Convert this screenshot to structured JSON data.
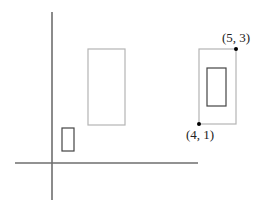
{
  "diagram": {
    "colors": {
      "axis": "#6e6e6e",
      "light_rect": "#b4b4b4",
      "dark_rect": "#444444",
      "point": "#000000",
      "label": "#222222"
    },
    "axes": {
      "vertical": {
        "x": 52,
        "y1": 12,
        "y2": 200
      },
      "horizontal": {
        "y": 163,
        "x1": 15,
        "x2": 198
      }
    },
    "rects": [
      {
        "name": "small-dark-rect",
        "x": 62,
        "y": 128,
        "w": 12,
        "h": 23,
        "style": "dark"
      },
      {
        "name": "middle-light-rect",
        "x": 88,
        "y": 49,
        "w": 37,
        "h": 76,
        "style": "light"
      },
      {
        "name": "right-light-rect",
        "x": 199,
        "y": 49,
        "w": 37,
        "h": 75,
        "style": "light"
      },
      {
        "name": "right-inner-dark-rect",
        "x": 207,
        "y": 68,
        "w": 19,
        "h": 38,
        "style": "dark"
      }
    ],
    "points": [
      {
        "name": "point-top-right",
        "label": "(5, 3)",
        "cx": 236,
        "cy": 49,
        "label_x": 222,
        "label_y": 42
      },
      {
        "name": "point-bottom-left",
        "label": "(4, 1)",
        "cx": 199,
        "cy": 124,
        "label_x": 186,
        "label_y": 139
      }
    ]
  }
}
